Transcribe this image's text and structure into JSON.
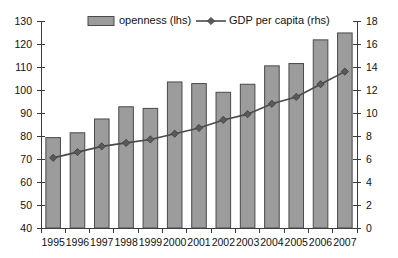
{
  "chart_data": {
    "type": "bar",
    "title": "",
    "subtitle": "",
    "xlabel": "",
    "ylabel": "",
    "grid": false,
    "legend_position": "top",
    "categories": [
      "1995",
      "1996",
      "1997",
      "1998",
      "1999",
      "2000",
      "2001",
      "2002",
      "2003",
      "2004",
      "2005",
      "2006",
      "2007"
    ],
    "axes": {
      "left": {
        "label": "",
        "min": 40,
        "max": 130,
        "step": 10,
        "ticks": [
          "40",
          "50",
          "60",
          "70",
          "80",
          "90",
          "100",
          "110",
          "120",
          "130"
        ]
      },
      "right": {
        "label": "",
        "min": 0,
        "max": 18,
        "step": 2,
        "ticks": [
          "0",
          "2",
          "4",
          "6",
          "8",
          "10",
          "12",
          "14",
          "16",
          "18"
        ]
      }
    },
    "series": [
      {
        "name": "openness (lhs)",
        "type": "bar",
        "axis": "left",
        "color": "#9c9c9c",
        "values": [
          79.3,
          81.4,
          87.4,
          92.7,
          92.0,
          103.5,
          102.8,
          99.0,
          102.5,
          110.5,
          111.5,
          121.8,
          124.8
        ]
      },
      {
        "name": "GDP per capita (rhs)",
        "type": "line",
        "axis": "right",
        "color": "#4a4a4a",
        "marker": "diamond",
        "values": [
          6.1,
          6.6,
          7.1,
          7.4,
          7.7,
          8.2,
          8.7,
          9.4,
          9.9,
          10.8,
          11.4,
          12.5,
          13.6
        ]
      }
    ]
  },
  "legend": {
    "items": [
      {
        "label": "openness (lhs)",
        "marker": "bar-swatch"
      },
      {
        "label": "GDP per capita (rhs)",
        "marker": "line-diamond"
      }
    ]
  },
  "colors": {
    "bar_fill": "#9c9c9c",
    "bar_stroke": "#4a4a4a",
    "line": "#4a4a4a",
    "axis": "#3b3b3b",
    "text": "#111111",
    "background": "#ffffff"
  }
}
